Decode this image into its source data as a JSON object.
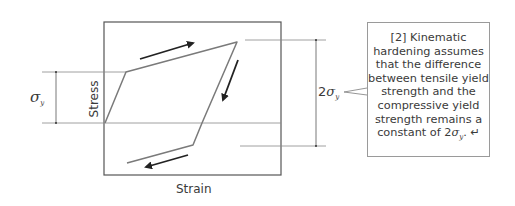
{
  "diagram": {
    "type": "kinematic-hardening-stress-strain",
    "axis_labels": {
      "x": "Strain",
      "y": "Stress"
    },
    "dimension_labels": {
      "left": {
        "symbol": "σ",
        "subscript": "y"
      },
      "right": {
        "prefix": "2",
        "symbol": "σ",
        "subscript": "y"
      }
    },
    "callout": {
      "lines": [
        "[2] Kinematic",
        "hardening assumes",
        "that the difference",
        "between tensile yield",
        "strength and the",
        "compressive yield",
        "strength remains a"
      ],
      "last_line_prefix": "constant of ",
      "last_line_coeff": "2",
      "last_line_symbol": "σ",
      "last_line_subscript": "y",
      "last_line_suffix": ".",
      "return_mark": "↵"
    },
    "colors": {
      "line": "#7a7a7a",
      "arrow": "#222222",
      "frame": "#555555"
    }
  }
}
